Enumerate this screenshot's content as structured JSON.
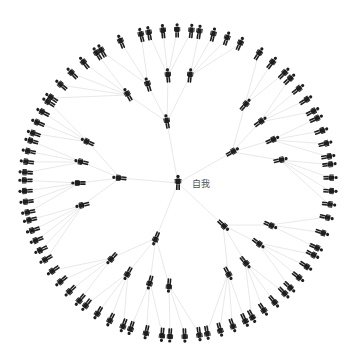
{
  "diagram": {
    "title": "",
    "center": {
      "label": "自我",
      "x": 178,
      "y": 183,
      "icon": "person-icon"
    },
    "colors": {
      "edge": "#e2e2e2",
      "icon": "#1e1e1e",
      "label": "#555555",
      "background": "#ffffff"
    },
    "branches": [
      {
        "name": "top",
        "hub": {
          "x": 167,
          "y": 122
        },
        "children": [
          {
            "x": 128,
            "y": 95,
            "leaves_from_deg": 214,
            "leaves_to_deg": 238,
            "count": 5
          },
          {
            "x": 148,
            "y": 85,
            "leaves_from_deg": 240,
            "leaves_to_deg": 256,
            "count": 3
          },
          {
            "x": 168,
            "y": 76,
            "leaves_from_deg": 259,
            "leaves_to_deg": 275,
            "count": 4
          },
          {
            "x": 190,
            "y": 76,
            "leaves_from_deg": 278,
            "leaves_to_deg": 294,
            "count": 4
          }
        ]
      },
      {
        "name": "upper-right",
        "hub": {
          "x": 232,
          "y": 152
        },
        "children": [
          {
            "x": 245,
            "y": 105,
            "leaves_from_deg": 302,
            "leaves_to_deg": 314,
            "count": 3
          },
          {
            "x": 260,
            "y": 122,
            "leaves_from_deg": 317,
            "leaves_to_deg": 332,
            "count": 4
          },
          {
            "x": 272,
            "y": 140,
            "leaves_from_deg": 335,
            "leaves_to_deg": 350,
            "count": 4
          },
          {
            "x": 280,
            "y": 160,
            "leaves_from_deg": 353,
            "leaves_to_deg": 368,
            "count": 4
          }
        ]
      },
      {
        "name": "lower-right",
        "hub": {
          "x": 223,
          "y": 225
        },
        "children": [
          {
            "x": 270,
            "y": 225,
            "leaves_from_deg": 13,
            "leaves_to_deg": 25,
            "count": 3
          },
          {
            "x": 258,
            "y": 243,
            "leaves_from_deg": 28,
            "leaves_to_deg": 43,
            "count": 4
          },
          {
            "x": 245,
            "y": 262,
            "leaves_from_deg": 46,
            "leaves_to_deg": 61,
            "count": 4
          },
          {
            "x": 228,
            "y": 273,
            "leaves_from_deg": 64,
            "leaves_to_deg": 79,
            "count": 4
          }
        ]
      },
      {
        "name": "lower-left",
        "hub": {
          "x": 156,
          "y": 238
        },
        "children": [
          {
            "x": 112,
            "y": 258,
            "leaves_from_deg": 130,
            "leaves_to_deg": 145,
            "count": 4
          },
          {
            "x": 128,
            "y": 273,
            "leaves_from_deg": 111,
            "leaves_to_deg": 127,
            "count": 4
          },
          {
            "x": 150,
            "y": 282,
            "leaves_from_deg": 96,
            "leaves_to_deg": 108,
            "count": 3
          },
          {
            "x": 169,
            "y": 285,
            "leaves_from_deg": 82,
            "leaves_to_deg": 93,
            "count": 3
          }
        ]
      },
      {
        "name": "left",
        "hub": {
          "x": 120,
          "y": 178
        },
        "children": [
          {
            "x": 88,
            "y": 142,
            "leaves_from_deg": 199,
            "leaves_to_deg": 212,
            "count": 4
          },
          {
            "x": 82,
            "y": 162,
            "leaves_from_deg": 184,
            "leaves_to_deg": 196,
            "count": 4
          },
          {
            "x": 79,
            "y": 183,
            "leaves_from_deg": 169,
            "leaves_to_deg": 181,
            "count": 4
          },
          {
            "x": 83,
            "y": 205,
            "leaves_from_deg": 150,
            "leaves_to_deg": 166,
            "count": 5
          }
        ]
      }
    ],
    "outer_radius": 152
  }
}
